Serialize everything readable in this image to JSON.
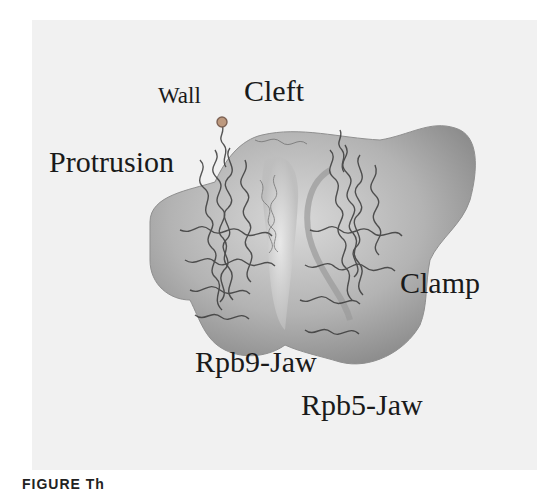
{
  "figure": {
    "labels": {
      "wall": "Wall",
      "cleft": "Cleft",
      "protrusion": "Protrusion",
      "clamp": "Clamp",
      "rpb9_jaw": "Rpb9-Jaw",
      "rpb5_jaw": "Rpb5-Jaw"
    },
    "caption_fragment": "FIGURE        Th",
    "colors": {
      "background_panel": "#f1f1f1",
      "density_surface": "#a9a9a9",
      "ribbon": "#3a3a3a",
      "label_text": "#1a1a1a"
    }
  }
}
